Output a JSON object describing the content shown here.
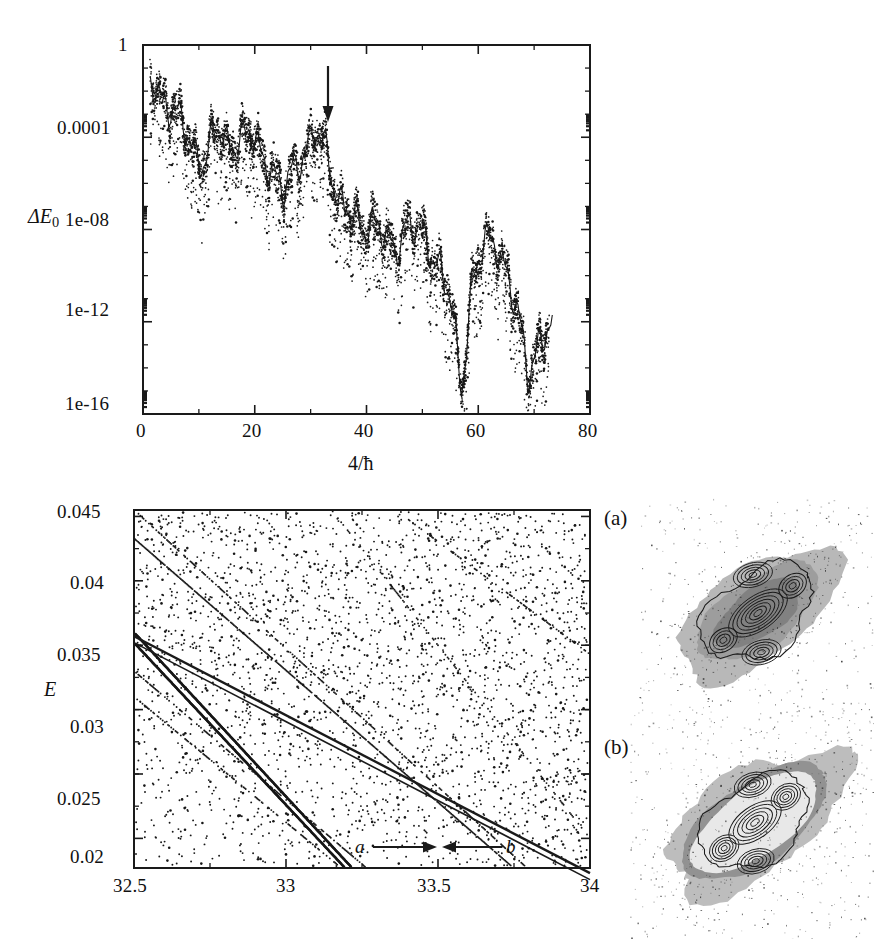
{
  "figure": {
    "background_color": "#ffffff",
    "ink_color": "#1a1a1a"
  },
  "chart_data": [
    {
      "id": "top-panel",
      "type": "scatter",
      "title": "",
      "xlabel": "4/ħ",
      "ylabel": "ΔE₀",
      "yscale": "log",
      "xlim": [
        0,
        80
      ],
      "ylim": [
        1e-16,
        1
      ],
      "grid": false,
      "legend": null,
      "xticks": [
        0,
        20,
        40,
        60,
        80
      ],
      "xtick_labels": [
        "0",
        "20",
        "40",
        "60",
        "80"
      ],
      "yticks": [
        1,
        0.0001,
        1e-08,
        1e-12,
        1e-16
      ],
      "ytick_labels": [
        "1",
        "0.0001",
        "1e-08",
        "1e-12",
        "1e-16"
      ],
      "annotations": [
        {
          "type": "arrow",
          "direction": "down",
          "x": 32.5,
          "y_top": 0.02,
          "y_bottom": 0.0009,
          "label": ""
        }
      ],
      "description": "Scatter cloud of splitting values decaying from ~1e-2 at small 4/hbar to ~1e-16 near 4/hbar = 72, overlaid by a mean curve with plateau-and-spike structure.",
      "envelope_x": [
        1.5,
        3,
        5,
        7,
        9,
        11,
        13,
        15,
        17,
        19,
        21,
        23,
        25,
        27,
        29,
        31,
        33,
        35,
        37,
        39,
        41,
        43,
        45,
        47,
        49,
        51,
        53,
        55,
        57,
        59,
        61,
        63,
        65,
        67,
        69,
        71,
        73
      ],
      "envelope_y": [
        0.02,
        0.005,
        0.003,
        0.0004,
        2e-05,
        1.2e-05,
        0.0002,
        4e-05,
        8e-05,
        0.00015,
        2e-05,
        6e-06,
        3e-07,
        5e-06,
        3e-05,
        0.00015,
        2e-05,
        2e-07,
        4e-08,
        1e-08,
        3e-08,
        6e-09,
        1e-09,
        2e-08,
        8e-09,
        2e-09,
        3e-10,
        1e-11,
        1e-15,
        1e-10,
        2e-09,
        3e-09,
        2e-10,
        2e-12,
        5e-15,
        2e-13,
        5e-13
      ]
    },
    {
      "id": "bottom-left-panel",
      "type": "scatter",
      "title": "",
      "xlabel": "",
      "ylabel": "E",
      "yscale": "linear",
      "xlim": [
        32.5,
        34.0
      ],
      "ylim": [
        0.0177,
        0.0455
      ],
      "grid": false,
      "legend": null,
      "xticks": [
        32.5,
        33,
        33.5,
        34
      ],
      "xtick_labels": [
        "32.5",
        "33",
        "33.5",
        "34"
      ],
      "yticks": [
        0.02,
        0.025,
        0.03,
        0.035,
        0.04,
        0.045
      ],
      "ytick_labels": [
        "0.02",
        "0.025",
        "0.03",
        "0.035",
        "0.04",
        "0.045"
      ],
      "annotations": [
        {
          "type": "arrow",
          "direction": "right",
          "label": "a",
          "label_x": 33.35,
          "y": 0.0188
        },
        {
          "type": "arrow",
          "direction": "left",
          "label": "b",
          "label_x": 33.78,
          "y": 0.0188
        }
      ],
      "description": "Energy level diagram versus 4/hbar showing descending level lines and a dense quasi-random background of levels; a prominent dark descending line passes through an avoided crossing marked by arrows a and b."
    }
  ],
  "insets": [
    {
      "id": "husimi-a",
      "label": "(a)",
      "description": "Grayscale Husimi distribution: diagonal cross-shaped support with nested elliptical contour rings at the centre and two satellite lobes."
    },
    {
      "id": "husimi-b",
      "label": "(b)",
      "description": "Grayscale Husimi distribution: larger hexagonal/diamond support with a bright interior and nested elliptical contour rings plus four satellite lobes."
    }
  ],
  "top_panel": {
    "y_axis_title": "ΔE",
    "y_axis_title_sub": "0",
    "x_axis_title": "4/ħ",
    "y_tick_labels": [
      "1",
      "0.0001",
      "1e-08",
      "1e-12",
      "1e-16"
    ],
    "x_tick_labels": [
      "0",
      "20",
      "40",
      "60",
      "80"
    ]
  },
  "bottom_panel": {
    "y_axis_title": "E",
    "y_tick_labels": [
      "0.045",
      "0.04",
      "0.035",
      "0.03",
      "0.025",
      "0.02"
    ],
    "x_tick_labels": [
      "32.5",
      "33",
      "33.5",
      "34"
    ],
    "arrow_label_a": "a",
    "arrow_label_b": "b"
  },
  "panel_labels": {
    "a": "(a)",
    "b": "(b)"
  }
}
